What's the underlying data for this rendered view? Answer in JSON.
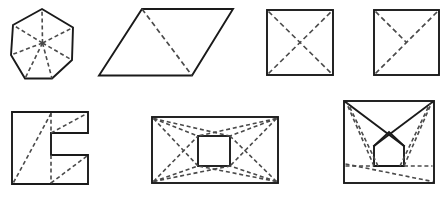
{
  "sheet": {
    "title": "Geometric decomposition figures",
    "width": 446,
    "height": 198,
    "background_color": "#ffffff",
    "solid_stroke_color": "#1a1a1a",
    "dashed_stroke_color": "#4a4a4a",
    "figure_count": 7,
    "rows": 2,
    "row_counts": [
      4,
      3
    ]
  },
  "figures": [
    {
      "id": "figure-1",
      "name": "heptagon-with-center-spokes",
      "row": 1,
      "position": 1,
      "shape": "heptagon",
      "description": "Regular heptagon with seven dashed spokes from center to each vertex",
      "solid_segments": 7,
      "dashed_segments": 7,
      "outline_points": "73,42 58.6,8.4 23.6,13.7 11.4,46.9 32.6,75.2 67.9,70.8",
      "center": {
        "x": 42.5,
        "y": 43.0
      },
      "vertices": [
        {
          "x": 42.0,
          "y": 9.0
        },
        {
          "x": 73.0,
          "y": 27.5
        },
        {
          "x": 72.0,
          "y": 60.0
        },
        {
          "x": 52.0,
          "y": 78.5
        },
        {
          "x": 25.0,
          "y": 78.5
        },
        {
          "x": 11.0,
          "y": 55.0
        },
        {
          "x": 13.0,
          "y": 25.0
        }
      ]
    },
    {
      "id": "figure-2",
      "name": "parallelogram-with-one-diagonal",
      "row": 1,
      "position": 2,
      "shape": "parallelogram",
      "description": "Parallelogram divided into two triangles by a single dashed diagonal",
      "solid_segments": 4,
      "dashed_segments": 1,
      "vertices": [
        {
          "x": 142.0,
          "y": 9.0
        },
        {
          "x": 233.0,
          "y": 9.0
        },
        {
          "x": 192.0,
          "y": 75.5
        },
        {
          "x": 99.0,
          "y": 75.5
        }
      ],
      "diagonal": {
        "from": {
          "x": 142.0,
          "y": 9.0
        },
        "to": {
          "x": 192.0,
          "y": 75.5
        }
      }
    },
    {
      "id": "figure-3",
      "name": "square-with-both-diagonals",
      "row": 1,
      "position": 3,
      "shape": "square",
      "description": "Square crossed by both dashed diagonals meeting at the center",
      "solid_segments": 4,
      "dashed_segments": 2,
      "bounds": {
        "x": 267.0,
        "y": 10.0,
        "width": 66.0,
        "height": 65.0
      }
    },
    {
      "id": "figure-4",
      "name": "square-with-diagonal-and-half-diagonal",
      "row": 1,
      "position": 4,
      "shape": "square",
      "description": "Square with one full dashed diagonal from bottom-left to top-right plus a dashed half-diagonal from top-left to the center",
      "solid_segments": 4,
      "dashed_segments": 2,
      "bounds": {
        "x": 374.0,
        "y": 10.0,
        "width": 65.0,
        "height": 65.0
      }
    },
    {
      "id": "figure-5",
      "name": "c-bracket-polygon-with-dashed-cuts",
      "row": 2,
      "position": 1,
      "shape": "c-shaped-polygon",
      "description": "C / bracket shaped polygon with two notches; dashed long diagonal, dashed notch verticals and dashed arm diagonals",
      "solid_segments": 12,
      "dashed_segments": 5,
      "bounds": {
        "x": 12.0,
        "y": 112.0,
        "width": 76.0,
        "height": 72.0
      }
    },
    {
      "id": "figure-6",
      "name": "rectangle-with-inner-square-and-corner-rays",
      "row": 2,
      "position": 2,
      "shape": "rectangle-with-inner-square",
      "description": "Rectangle containing a centered square; dashed rays connect every outer corner to the inner square corners and the outer diagonals",
      "solid_segments": 8,
      "dashed_segments": 12,
      "outer_bounds": {
        "x": 152.0,
        "y": 117.0,
        "width": 126.0,
        "height": 66.0
      },
      "inner_bounds": {
        "x": 198.0,
        "y": 136.0,
        "width": 32.0,
        "height": 30.0
      }
    },
    {
      "id": "figure-7",
      "name": "square-with-crossed-rays-and-house-pentagon",
      "row": 2,
      "position": 3,
      "shape": "square-with-inscribed-pentagon",
      "description": "Square with two solid rays from the upper corners crossing near the center to form a house-shaped pentagon; dashed rays to the top corners, a dashed horizontal and a dashed long diagonal below",
      "solid_segments": 9,
      "dashed_segments": 7,
      "bounds": {
        "x": 344.0,
        "y": 100.0,
        "width": 90.0,
        "height": 83.0
      }
    }
  ]
}
